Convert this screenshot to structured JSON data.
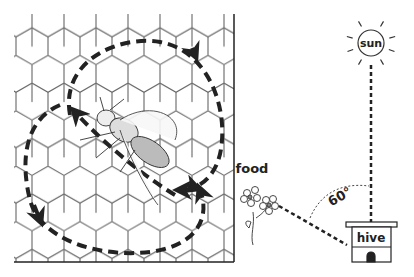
{
  "diagram": {
    "labels": {
      "sun": "sun",
      "food": "food",
      "hive": "hive",
      "angle": "60°"
    },
    "elements": [
      {
        "name": "honeycomb",
        "icon": "honeycomb-icon"
      },
      {
        "name": "dancing-bee",
        "icon": "bee-icon"
      },
      {
        "name": "dance-path",
        "description": "figure-eight dashed path with arrows"
      },
      {
        "name": "sun",
        "icon": "sun-icon"
      },
      {
        "name": "flower",
        "icon": "flower-icon"
      },
      {
        "name": "hive",
        "icon": "hive-icon"
      }
    ],
    "colors": {
      "ink": "#222222",
      "comb": "#555555",
      "background": "#ffffff"
    }
  }
}
